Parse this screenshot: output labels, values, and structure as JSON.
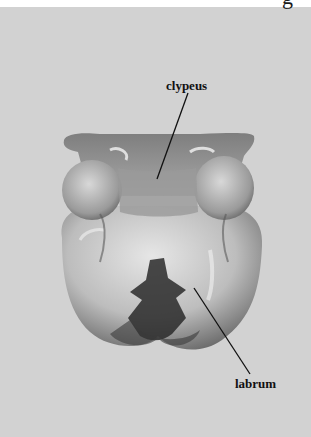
{
  "figure": {
    "type": "photograph",
    "background_color": "#d2d2d2",
    "labels": [
      {
        "id": "clypeus",
        "text": "clypeus",
        "line_from": [
          188,
          93
        ],
        "line_to": [
          157,
          179
        ]
      },
      {
        "id": "labrum",
        "text": "labrum",
        "line_from": [
          194,
          288
        ],
        "line_to": [
          250,
          374
        ]
      }
    ],
    "partial_header_glyph": "g"
  }
}
